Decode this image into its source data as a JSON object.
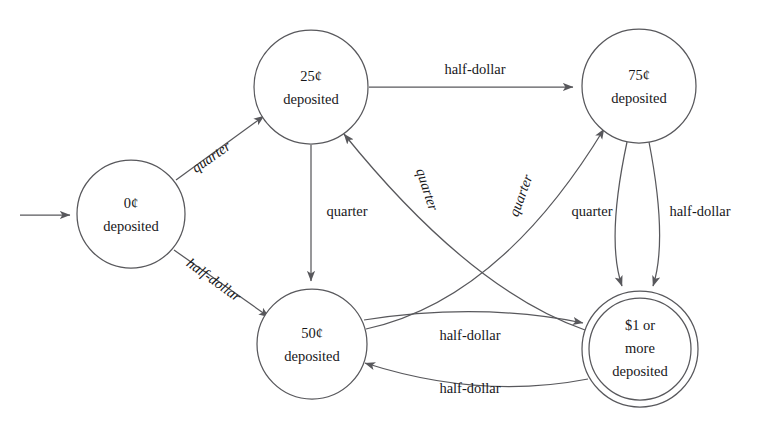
{
  "diagram": {
    "type": "finite-state-machine",
    "stroke_color": "#58585c",
    "text_color": "#17171a",
    "background_color": "#ffffff",
    "start_marker": "start-arrow"
  },
  "states": [
    {
      "id": "s0",
      "name": "zero-cents-deposited",
      "lines": [
        "0¢",
        "deposited"
      ],
      "line1": "0¢",
      "line2": "deposited",
      "line3": "",
      "cx": 131,
      "cy": 214,
      "r": 54,
      "accepting": false,
      "initial": true
    },
    {
      "id": "s25",
      "name": "twentyfive-cents-deposited",
      "lines": [
        "25¢",
        "deposited"
      ],
      "line1": "25¢",
      "line2": "deposited",
      "line3": "",
      "cx": 311,
      "cy": 87,
      "r": 57,
      "accepting": false,
      "initial": false
    },
    {
      "id": "s50",
      "name": "fifty-cents-deposited",
      "lines": [
        "50¢",
        "deposited"
      ],
      "line1": "50¢",
      "line2": "deposited",
      "line3": "",
      "cx": 312,
      "cy": 344,
      "r": 55,
      "accepting": false,
      "initial": false
    },
    {
      "id": "s75",
      "name": "seventyfive-cents-deposited",
      "lines": [
        "75¢",
        "deposited"
      ],
      "line1": "75¢",
      "line2": "deposited",
      "line3": "",
      "cx": 639,
      "cy": 86,
      "r": 57,
      "accepting": false,
      "initial": false
    },
    {
      "id": "s100",
      "name": "one-dollar-or-more-deposited",
      "lines": [
        "$1 or",
        "more",
        "deposited"
      ],
      "line1": "$1 or",
      "line2": "more",
      "line3": "deposited",
      "cx": 640,
      "cy": 349,
      "r": 58,
      "r_inner": 51,
      "accepting": true,
      "initial": false
    }
  ],
  "transitions": [
    {
      "id": "t1",
      "name": "zero-to-twentyfive-quarter",
      "from": "s0",
      "to": "s25",
      "label": "quarter",
      "label_x": 212,
      "label_y": 158,
      "rotation": -35,
      "style": "slanted"
    },
    {
      "id": "t2",
      "name": "zero-to-fifty-half-dollar",
      "from": "s0",
      "to": "s50",
      "label": "half-dollar",
      "label_x": 213,
      "label_y": 281,
      "rotation": 36,
      "style": "slanted"
    },
    {
      "id": "t3",
      "name": "twentyfive-to-seventyfive-half-dollar",
      "from": "s25",
      "to": "s75",
      "label": "half-dollar",
      "label_x": 475,
      "label_y": 71,
      "rotation": 0,
      "style": "flat"
    },
    {
      "id": "t4",
      "name": "twentyfive-to-fifty-quarter",
      "from": "s25",
      "to": "s50",
      "label": "quarter",
      "label_x": 347,
      "label_y": 213,
      "rotation": 0,
      "style": "flat"
    },
    {
      "id": "t5",
      "name": "onedollar-to-twentyfive-quarter",
      "from": "s100",
      "to": "s25",
      "label": "quarter",
      "label_x": 426,
      "label_y": 190,
      "rotation": 72,
      "style": "slanted"
    },
    {
      "id": "t6",
      "name": "fifty-to-seventyfive-quarter",
      "from": "s50",
      "to": "s75",
      "label": "quarter",
      "label_x": 522,
      "label_y": 196,
      "rotation": -70,
      "style": "slanted"
    },
    {
      "id": "t7",
      "name": "seventyfive-to-onedollar-quarter",
      "from": "s75",
      "to": "s100",
      "label": "quarter",
      "label_x": 592,
      "label_y": 213,
      "rotation": 0,
      "style": "flat"
    },
    {
      "id": "t8",
      "name": "seventyfive-to-onedollar-half-dollar",
      "from": "s75",
      "to": "s100",
      "label": "half-dollar",
      "label_x": 700,
      "label_y": 213,
      "rotation": 0,
      "style": "flat"
    },
    {
      "id": "t9",
      "name": "fifty-to-onedollar-half-dollar",
      "from": "s50",
      "to": "s100",
      "label": "half-dollar",
      "label_x": 470,
      "label_y": 337,
      "rotation": 0,
      "style": "flat"
    },
    {
      "id": "t10",
      "name": "onedollar-to-fifty-half-dollar",
      "from": "s100",
      "to": "s50",
      "label": "half-dollar",
      "label_x": 470,
      "label_y": 390,
      "rotation": 0,
      "style": "flat"
    }
  ]
}
